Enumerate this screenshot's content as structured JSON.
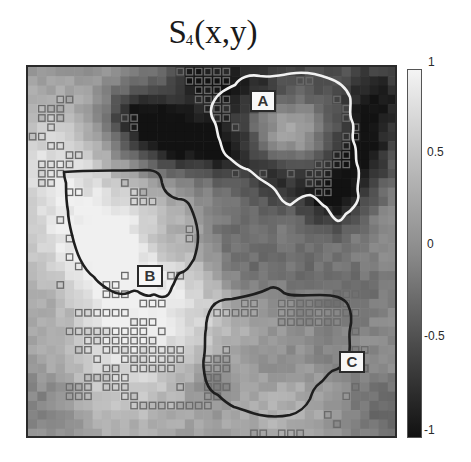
{
  "title": {
    "main": "S",
    "subscript": "4",
    "suffix": "(x,y)"
  },
  "colorbar": {
    "ticks": [
      {
        "label": "1",
        "value": 1
      },
      {
        "label": "0.5",
        "value": 0.5
      },
      {
        "label": "0",
        "value": 0
      },
      {
        "label": "-0.5",
        "value": -0.5
      },
      {
        "label": "-1",
        "value": -1
      }
    ],
    "range": [
      -1,
      1
    ],
    "colormap": "gray"
  },
  "regions": [
    {
      "label": "A",
      "outline_color": "#f2f2f2"
    },
    {
      "label": "B",
      "outline_color": "#1e1e1e"
    },
    {
      "label": "C",
      "outline_color": "#1e1e1e"
    }
  ],
  "chart_data": {
    "type": "heatmap",
    "title": "S4(x,y)",
    "xlabel": "",
    "ylabel": "",
    "grid": {
      "rows": 40,
      "cols": 40
    },
    "colorbar": {
      "min": -1,
      "max": 1,
      "ticks": [
        1,
        0.5,
        0,
        -0.5,
        -1
      ],
      "tick_labels": [
        "1",
        "0.5",
        "0",
        "-0.5",
        "-1"
      ]
    },
    "annotations": [
      {
        "text": "A",
        "approx_cell": [
          4,
          24
        ],
        "outline": "white"
      },
      {
        "text": "B",
        "approx_cell": [
          21,
          12
        ],
        "outline": "black"
      },
      {
        "text": "C",
        "approx_cell": [
          31,
          34
        ],
        "outline": "black"
      }
    ],
    "legend": null,
    "marked_cells_description": "small open squares mark selected grid cells"
  }
}
